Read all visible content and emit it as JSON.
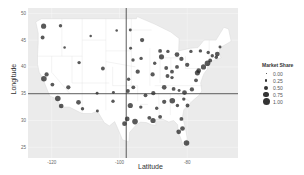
{
  "chart_data": {
    "type": "scatter",
    "title": "",
    "xlabel": "Latitude",
    "ylabel": "Longitude",
    "x_ticks": [
      "-120",
      "-100",
      "-80"
    ],
    "y_ticks": [
      "50",
      "45",
      "40",
      "35",
      "30",
      "25"
    ],
    "xlim": [
      -127,
      -65
    ],
    "ylim": [
      23,
      51
    ],
    "grid": true,
    "reference_lines": {
      "vertical_x": -98,
      "horizontal_y": 35
    },
    "legend": {
      "title": "Market Share",
      "position": "right",
      "entries": [
        "0.00",
        "0.25",
        "0.50",
        "0.75",
        "1.00"
      ]
    },
    "background": "map of contiguous United States with state borders",
    "points": [
      {
        "x": -122.4,
        "y": 47.6,
        "size": 0.9
      },
      {
        "x": -122.7,
        "y": 45.5,
        "size": 0.6
      },
      {
        "x": -116.2,
        "y": 43.6,
        "size": 0.3
      },
      {
        "x": -111.9,
        "y": 40.8,
        "size": 0.5
      },
      {
        "x": -104.9,
        "y": 39.7,
        "size": 0.6
      },
      {
        "x": -122.3,
        "y": 37.8,
        "size": 1.0
      },
      {
        "x": -121.5,
        "y": 38.6,
        "size": 0.7
      },
      {
        "x": -119.8,
        "y": 36.7,
        "size": 0.6
      },
      {
        "x": -118.2,
        "y": 34.1,
        "size": 1.0
      },
      {
        "x": -117.2,
        "y": 32.7,
        "size": 0.8
      },
      {
        "x": -115.1,
        "y": 36.2,
        "size": 0.7
      },
      {
        "x": -112.1,
        "y": 33.4,
        "size": 0.8
      },
      {
        "x": -110.9,
        "y": 32.2,
        "size": 0.5
      },
      {
        "x": -106.6,
        "y": 35.1,
        "size": 0.4
      },
      {
        "x": -106.5,
        "y": 31.8,
        "size": 0.4
      },
      {
        "x": -97.7,
        "y": 30.3,
        "size": 0.8
      },
      {
        "x": -96.8,
        "y": 32.8,
        "size": 0.9
      },
      {
        "x": -95.4,
        "y": 29.8,
        "size": 1.0
      },
      {
        "x": -98.5,
        "y": 29.4,
        "size": 0.8
      },
      {
        "x": -97.5,
        "y": 35.5,
        "size": 0.6
      },
      {
        "x": -95.9,
        "y": 36.2,
        "size": 0.6
      },
      {
        "x": -94.6,
        "y": 39.1,
        "size": 0.7
      },
      {
        "x": -90.2,
        "y": 38.6,
        "size": 0.7
      },
      {
        "x": -93.3,
        "y": 45.0,
        "size": 0.7
      },
      {
        "x": -87.6,
        "y": 41.9,
        "size": 0.9
      },
      {
        "x": -83.0,
        "y": 42.3,
        "size": 0.8
      },
      {
        "x": -86.2,
        "y": 39.8,
        "size": 0.6
      },
      {
        "x": -84.5,
        "y": 39.1,
        "size": 0.6
      },
      {
        "x": -83.0,
        "y": 40.0,
        "size": 0.6
      },
      {
        "x": -81.7,
        "y": 41.5,
        "size": 0.7
      },
      {
        "x": -80.0,
        "y": 40.4,
        "size": 0.7
      },
      {
        "x": -86.8,
        "y": 36.2,
        "size": 0.8
      },
      {
        "x": -90.0,
        "y": 35.1,
        "size": 0.7
      },
      {
        "x": -84.4,
        "y": 33.7,
        "size": 1.0
      },
      {
        "x": -86.8,
        "y": 33.5,
        "size": 0.7
      },
      {
        "x": -90.1,
        "y": 30.0,
        "size": 0.9
      },
      {
        "x": -91.2,
        "y": 30.5,
        "size": 0.6
      },
      {
        "x": -88.0,
        "y": 30.7,
        "size": 0.6
      },
      {
        "x": -81.7,
        "y": 30.3,
        "size": 0.6
      },
      {
        "x": -81.4,
        "y": 28.5,
        "size": 0.8
      },
      {
        "x": -82.5,
        "y": 27.9,
        "size": 0.8
      },
      {
        "x": -80.2,
        "y": 25.8,
        "size": 1.0
      },
      {
        "x": -80.8,
        "y": 35.2,
        "size": 0.8
      },
      {
        "x": -78.6,
        "y": 35.8,
        "size": 0.7
      },
      {
        "x": -79.9,
        "y": 32.8,
        "size": 0.6
      },
      {
        "x": -77.4,
        "y": 37.5,
        "size": 0.6
      },
      {
        "x": -77.0,
        "y": 38.9,
        "size": 0.9
      },
      {
        "x": -76.6,
        "y": 39.3,
        "size": 0.8
      },
      {
        "x": -75.2,
        "y": 40.0,
        "size": 0.9
      },
      {
        "x": -74.0,
        "y": 40.7,
        "size": 1.0
      },
      {
        "x": -73.2,
        "y": 41.2,
        "size": 0.6
      },
      {
        "x": -71.1,
        "y": 42.4,
        "size": 0.8
      },
      {
        "x": -71.4,
        "y": 41.8,
        "size": 0.5
      },
      {
        "x": -73.8,
        "y": 42.7,
        "size": 0.5
      },
      {
        "x": -76.1,
        "y": 43.0,
        "size": 0.5
      },
      {
        "x": -78.9,
        "y": 42.9,
        "size": 0.5
      },
      {
        "x": -96.0,
        "y": 41.3,
        "size": 0.5
      },
      {
        "x": -97.3,
        "y": 37.7,
        "size": 0.5
      },
      {
        "x": -101.8,
        "y": 35.2,
        "size": 0.4
      },
      {
        "x": -101.9,
        "y": 33.6,
        "size": 0.5
      },
      {
        "x": -100.8,
        "y": 46.8,
        "size": 0.3
      },
      {
        "x": -96.8,
        "y": 46.9,
        "size": 0.4
      },
      {
        "x": -96.7,
        "y": 43.5,
        "size": 0.4
      },
      {
        "x": -108.5,
        "y": 45.8,
        "size": 0.3
      },
      {
        "x": -117.4,
        "y": 47.7,
        "size": 0.5
      },
      {
        "x": -88.0,
        "y": 43.0,
        "size": 0.6
      },
      {
        "x": -85.7,
        "y": 42.9,
        "size": 0.5
      },
      {
        "x": -85.8,
        "y": 38.3,
        "size": 0.6
      },
      {
        "x": -84.5,
        "y": 38.0,
        "size": 0.5
      },
      {
        "x": -92.3,
        "y": 34.7,
        "size": 0.6
      },
      {
        "x": -93.7,
        "y": 32.5,
        "size": 0.5
      },
      {
        "x": -89.0,
        "y": 32.3,
        "size": 0.5
      },
      {
        "x": -82.9,
        "y": 32.8,
        "size": 0.5
      },
      {
        "x": -81.0,
        "y": 34.0,
        "size": 0.5
      },
      {
        "x": -82.4,
        "y": 35.6,
        "size": 0.4
      },
      {
        "x": -84.0,
        "y": 35.9,
        "size": 0.6
      },
      {
        "x": -93.6,
        "y": 41.6,
        "size": 0.5
      },
      {
        "x": -89.6,
        "y": 40.7,
        "size": 0.5
      },
      {
        "x": -70.3,
        "y": 43.7,
        "size": 0.4
      },
      {
        "x": -72.6,
        "y": 42.1,
        "size": 0.5
      }
    ]
  }
}
